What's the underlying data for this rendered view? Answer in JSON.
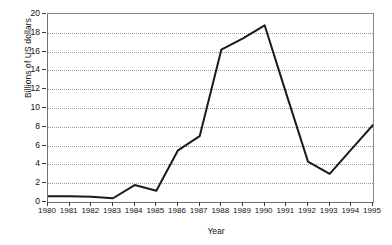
{
  "chart_data": {
    "type": "line",
    "title": "",
    "xlabel": "Year",
    "ylabel": "Billions of US dollars",
    "categories": [
      1980,
      1981,
      1982,
      1983,
      1984,
      1985,
      1986,
      1987,
      1988,
      1989,
      1990,
      1991,
      1992,
      1993,
      1994,
      1995
    ],
    "x_tick_labels": [
      "1980",
      "1981",
      "1982",
      "1983",
      "1984",
      "1985",
      "1986",
      "1987",
      "1988",
      "1989",
      "1990",
      "1991",
      "1992",
      "1993",
      "1994",
      "1995"
    ],
    "y_tick_labels": [
      "0",
      "2",
      "4",
      "6",
      "8",
      "10",
      "12",
      "14",
      "16",
      "18",
      "20"
    ],
    "y_ticks": [
      0,
      2,
      4,
      6,
      8,
      10,
      12,
      14,
      16,
      18,
      20
    ],
    "values": [
      0.6,
      0.6,
      0.55,
      0.4,
      1.8,
      1.2,
      5.5,
      7.0,
      16.2,
      17.4,
      18.8,
      11.5,
      4.3,
      3.0,
      5.6,
      8.2
    ],
    "series": [
      {
        "name": "Billions of US dollars",
        "values": [
          0.6,
          0.6,
          0.55,
          0.4,
          1.8,
          1.2,
          5.5,
          7.0,
          16.2,
          17.4,
          18.8,
          11.5,
          4.3,
          3.0,
          5.6,
          8.2
        ]
      }
    ],
    "xlim": [
      1980,
      1995
    ],
    "ylim": [
      0,
      20
    ],
    "grid": true,
    "grid_style": "dotted-horizontal",
    "legend": false,
    "legend_position": "none",
    "line_color": "#1a1a1a",
    "line_width": 2,
    "markers": false,
    "background_color": "#ffffff",
    "axis_color": "#6e6e6e",
    "grid_color": "#9a9a9a"
  }
}
